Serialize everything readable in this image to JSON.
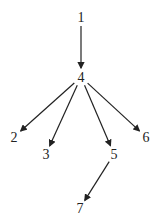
{
  "diagram": {
    "type": "tree",
    "nodes": [
      {
        "id": "1",
        "label": "1",
        "x": 81,
        "y": 17
      },
      {
        "id": "4",
        "label": "4",
        "x": 81,
        "y": 77
      },
      {
        "id": "2",
        "label": "2",
        "x": 14,
        "y": 137
      },
      {
        "id": "3",
        "label": "3",
        "x": 46,
        "y": 154
      },
      {
        "id": "5",
        "label": "5",
        "x": 114,
        "y": 154
      },
      {
        "id": "6",
        "label": "6",
        "x": 146,
        "y": 137
      },
      {
        "id": "7",
        "label": "7",
        "x": 80,
        "y": 208
      }
    ],
    "edges": [
      {
        "from": "1",
        "to": "4"
      },
      {
        "from": "4",
        "to": "2"
      },
      {
        "from": "4",
        "to": "3"
      },
      {
        "from": "4",
        "to": "5"
      },
      {
        "from": "4",
        "to": "6"
      },
      {
        "from": "5",
        "to": "7"
      }
    ]
  }
}
